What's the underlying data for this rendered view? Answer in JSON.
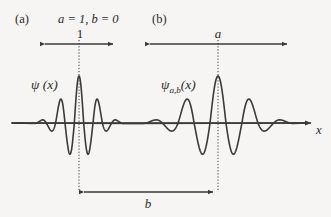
{
  "figure": {
    "background_color": "#f6f5f3",
    "stroke_color": "#3a3a3a",
    "panel_a_tag": "(a)",
    "panel_b_tag": "(b)",
    "parameters_text": "a = 1, b = 0",
    "axis_label_x": "x",
    "function_label_a": "ψ (x)",
    "function_label_b_main": "ψ",
    "function_label_b_sub": "a,b",
    "function_label_b_tail": "(x)",
    "scale_label_a": "1",
    "scale_label_b": "a",
    "shift_label": "b"
  },
  "chart_data": {
    "type": "line",
    "title": "",
    "xlabel": "x",
    "ylabel": "",
    "grid": false,
    "legend": null,
    "axis": {
      "baseline_y": 123,
      "x_start": 12,
      "x_end": 312,
      "arrowhead": true
    },
    "series": [
      {
        "name": "psi(x)",
        "description": "Mother wavelet, Morlet-type: cos carrier times Gaussian envelope",
        "center_x": 79,
        "half_width": 44,
        "amplitude_up": 47,
        "amplitude_down": 37,
        "carrier_cycles": 2.35,
        "envelope_sigma": 0.36,
        "x_min": 35,
        "x_max": 123
      },
      {
        "name": "psi_{a,b}(x)",
        "description": "Scaled by a and translated by b version of the mother wavelet",
        "center_x": 218,
        "half_width": 75,
        "amplitude_up": 47,
        "amplitude_down": 37,
        "carrier_cycles": 2.35,
        "envelope_sigma": 0.36,
        "x_min": 143,
        "x_max": 293
      }
    ],
    "annotations": [
      {
        "name": "scale-bar-a",
        "kind": "double-arrow",
        "label": "1",
        "x1": 40,
        "x2": 118,
        "y": 44,
        "label_x": 80,
        "label_y": 27
      },
      {
        "name": "scale-bar-b",
        "kind": "double-arrow",
        "label": "a",
        "x1": 145,
        "x2": 292,
        "y": 44,
        "label_x": 218,
        "label_y": 27
      },
      {
        "name": "shift-bar",
        "kind": "double-arrow",
        "label": "b",
        "x1": 79,
        "x2": 218,
        "y": 192,
        "label_x": 148,
        "label_y": 197
      },
      {
        "name": "guide-line-a",
        "kind": "dotted-vertical",
        "x": 79,
        "y1": 40,
        "y2": 192
      },
      {
        "name": "guide-line-b",
        "kind": "dotted-vertical",
        "x": 218,
        "y1": 40,
        "y2": 192
      }
    ]
  }
}
